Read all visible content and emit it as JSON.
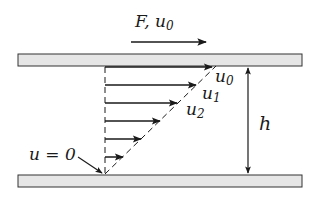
{
  "diagram": {
    "top_label": {
      "force": "F",
      "sep": ", ",
      "velocity": "u",
      "velocity_sub": "0"
    },
    "profile_labels": [
      {
        "name": "u",
        "sub": "0"
      },
      {
        "name": "u",
        "sub": "1"
      },
      {
        "name": "u",
        "sub": "2"
      }
    ],
    "gap_label": "h",
    "wall_label": {
      "lhs": "u",
      "eq": " = ",
      "rhs": "0"
    },
    "colors": {
      "plate_fill": "#e6e6e6",
      "plate_stroke": "#333333",
      "ink": "#1a1a1a"
    }
  }
}
